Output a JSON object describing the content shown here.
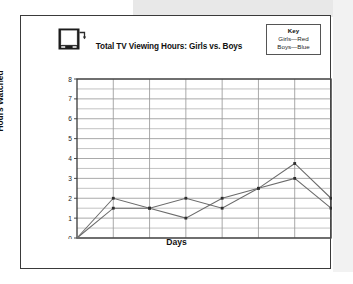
{
  "card": {
    "icon": "tv-icon",
    "title": "Total TV Viewing Hours: Girls vs. Boys"
  },
  "key": {
    "title": "Key",
    "rows": [
      "Girls—Red",
      "Boys—Blue"
    ]
  },
  "axes": {
    "x_title": "Days",
    "y_title": "Hours Watched",
    "y_ticks": [
      "0",
      "1",
      "2",
      "3",
      "4",
      "5",
      "6",
      "7",
      "8"
    ],
    "x_ticks": [
      "Monday",
      "Tuesday",
      "Wednesday",
      "Thursday",
      "Friday",
      "Saturday",
      "Sunday"
    ]
  },
  "colors": {
    "girls": "#d42a2a",
    "boys": "#2a49d4",
    "line_render": "#6b6b6b",
    "grid": "#9a9a9a",
    "axis": "#3a3a3a",
    "card_border": "#3a3a3a",
    "band": "#e8e8e8"
  },
  "chart_data": {
    "type": "line",
    "title": "Total TV Viewing Hours: Girls vs. Boys",
    "xlabel": "Days",
    "ylabel": "Hours Watched",
    "categories": [
      "Monday",
      "Tuesday",
      "Wednesday",
      "Thursday",
      "Friday",
      "Saturday",
      "Sunday"
    ],
    "ylim": [
      0,
      8
    ],
    "ytick_step": 1,
    "minor_gridline_step": 0.5,
    "grid": true,
    "legend_position": "top-right",
    "legend_entries": [
      "Girls—Red",
      "Boys—Blue"
    ],
    "origin_note": "both series begin at 0 on the y-axis before Monday",
    "series": [
      {
        "name": "Girls",
        "color": "#d42a2a",
        "origin_value": 0,
        "values": [
          2,
          1.5,
          2,
          1.5,
          2.5,
          3.75,
          2
        ]
      },
      {
        "name": "Boys",
        "color": "#2a49d4",
        "origin_value": 0,
        "values": [
          1.5,
          1.5,
          1,
          2,
          2.5,
          3,
          1.5
        ]
      }
    ]
  }
}
